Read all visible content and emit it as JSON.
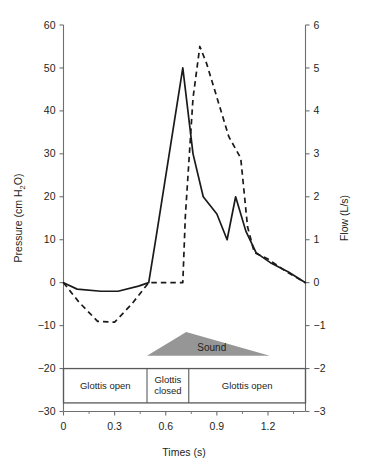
{
  "chart_data": {
    "type": "line",
    "title": "",
    "xlabel": "Times (s)",
    "ylabel": "Pressure (cm H₂O)",
    "y2label": "Flow (L/s)",
    "xlim": [
      0,
      1.42
    ],
    "ylim": [
      -30,
      60
    ],
    "y2lim": [
      -3,
      6
    ],
    "grid": false,
    "legend_position": "none",
    "x_ticks": [
      0,
      0.3,
      0.6,
      0.9,
      1.2
    ],
    "x_tick_labels": [
      "0",
      "0.3",
      "0.6",
      "0.9",
      "1.2"
    ],
    "x_minor_ticks": [
      0.15,
      0.45,
      0.75,
      1.05,
      1.35
    ],
    "y_ticks": [
      60,
      50,
      40,
      30,
      20,
      10,
      0,
      -10,
      -20,
      -30
    ],
    "y_tick_labels": [
      "60",
      "50",
      "40",
      "30",
      "20",
      "10",
      "0",
      "−10",
      "−20",
      "−30"
    ],
    "y2_ticks": [
      6,
      5,
      4,
      3,
      2,
      1,
      0,
      -1,
      -2,
      -3
    ],
    "y2_tick_labels": [
      "6",
      "5",
      "4",
      "3",
      "2",
      "1",
      "0",
      "−1",
      "−2",
      "−3"
    ],
    "series": [
      {
        "name": "Pressure",
        "axis": "left",
        "style": "solid",
        "color": "#1a1a1a",
        "units": "cm H2O",
        "x": [
          0.0,
          0.08,
          0.22,
          0.32,
          0.44,
          0.5,
          0.545,
          0.7,
          0.76,
          0.82,
          0.9,
          0.96,
          1.01,
          1.07,
          1.13,
          1.22,
          1.32,
          1.42
        ],
        "y": [
          0.0,
          -1.5,
          -2.0,
          -2.0,
          -0.8,
          0.0,
          11.0,
          50.0,
          30.0,
          20.0,
          16.0,
          10.0,
          20.0,
          12.0,
          7.0,
          4.5,
          2.5,
          0.0
        ]
      },
      {
        "name": "Flow",
        "axis": "right",
        "style": "dashed",
        "color": "#1a1a1a",
        "units": "L/s",
        "x": [
          0.0,
          0.09,
          0.2,
          0.3,
          0.4,
          0.5,
          0.7,
          0.715,
          0.76,
          0.8,
          0.84,
          0.97,
          1.04,
          1.08,
          1.12,
          1.2,
          1.31,
          1.42
        ],
        "y": [
          0.0,
          -0.45,
          -0.9,
          -0.92,
          -0.5,
          0.0,
          0.0,
          1.55,
          4.3,
          5.5,
          5.1,
          3.4,
          2.9,
          1.3,
          0.7,
          0.55,
          0.25,
          0.0
        ]
      }
    ],
    "annotations": [
      {
        "name": "sound-envelope",
        "label": "Sound",
        "shape": "triangle",
        "color": "#969696",
        "x_start": 0.49,
        "x_peak": 0.72,
        "x_end": 1.21,
        "y_baseline": -17.0,
        "y_peak": -11.5
      }
    ],
    "phase_bar": {
      "name": "glottis-phase-bar",
      "y_top": -20.0,
      "y_bottom": -28.0,
      "segments": [
        {
          "label": "Glottis open",
          "x_start": 0.0,
          "x_end": 0.49
        },
        {
          "label": "Glottis closed",
          "x_start": 0.49,
          "x_end": 0.735,
          "label_line1": "Glottis",
          "label_line2": "closed"
        },
        {
          "label": "Glottis open",
          "x_start": 0.735,
          "x_end": 1.42
        }
      ]
    },
    "colors": {
      "axis": "#6d6e71",
      "line": "#1a1a1a",
      "sound": "#969696",
      "box": "#58595b",
      "background": "#ffffff"
    }
  }
}
